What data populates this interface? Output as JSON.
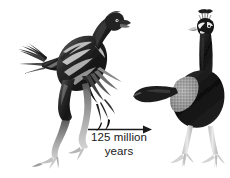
{
  "figure": {
    "background_color": "#ffffff",
    "ink_color": "#1a1a1a",
    "arrow": {
      "name": "time-arrow",
      "direction": "left-to-right",
      "color": "#1a1a1a"
    },
    "caption": {
      "line1": "125 million",
      "line2": "years",
      "full_text": "125 million years",
      "value": 125,
      "unit": "million years",
      "color": "#1a1a1a"
    },
    "specimens": [
      {
        "id": "feathered-dinosaur",
        "label": "feathered dinosaur",
        "position": "left",
        "facing": "right",
        "palette": {
          "body_dark": "#1e1e1e",
          "body_mid": "#4a4a4a",
          "band_light": "#d8d8d8",
          "limb_light": "#b9b9b9"
        }
      },
      {
        "id": "modern-peafowl",
        "label": "modern peafowl",
        "position": "right",
        "facing": "viewer",
        "palette": {
          "body_dark": "#141414",
          "wing_speckle": "#9a9a9a",
          "face_white": "#f2f2f2",
          "leg_light": "#cfcfcf"
        }
      }
    ]
  }
}
